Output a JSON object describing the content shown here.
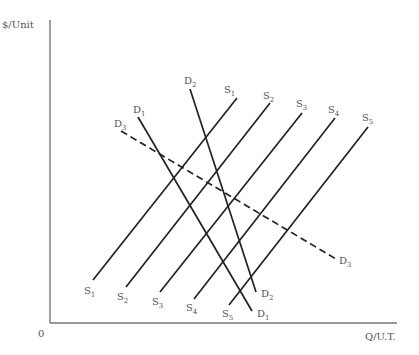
{
  "diagram": {
    "y_axis_label": "$/Unit",
    "x_axis_label": "Q/U.T.",
    "origin_label": "0",
    "colors": {
      "line": "#222222",
      "axis": "#777777",
      "text": "#555555"
    }
  },
  "chart_data": {
    "type": "line",
    "title": "",
    "xlabel": "Q/U.T.",
    "ylabel": "$/Unit",
    "series": [
      {
        "name": "S1",
        "style": "solid",
        "kind": "supply",
        "start_label": "S",
        "sub": "1",
        "points": [
          [
            93,
            280
          ],
          [
            237,
            98
          ]
        ]
      },
      {
        "name": "S2",
        "style": "solid",
        "kind": "supply",
        "start_label": "S",
        "sub": "2",
        "points": [
          [
            126,
            287
          ],
          [
            270,
            103
          ]
        ]
      },
      {
        "name": "S3",
        "style": "solid",
        "kind": "supply",
        "start_label": "S",
        "sub": "3",
        "points": [
          [
            160,
            292
          ],
          [
            302,
            113
          ]
        ]
      },
      {
        "name": "S4",
        "style": "solid",
        "kind": "supply",
        "start_label": "S",
        "sub": "4",
        "points": [
          [
            194,
            299
          ],
          [
            335,
            118
          ]
        ]
      },
      {
        "name": "S5",
        "style": "solid",
        "kind": "supply",
        "start_label": "S",
        "sub": "5",
        "points": [
          [
            229,
            305
          ],
          [
            368,
            127
          ]
        ]
      },
      {
        "name": "D1",
        "style": "solid",
        "kind": "demand",
        "start_label": "D",
        "sub": "1",
        "points": [
          [
            138,
            117
          ],
          [
            252,
            311
          ]
        ]
      },
      {
        "name": "D2",
        "style": "solid",
        "kind": "demand",
        "start_label": "D",
        "sub": "2",
        "points": [
          [
            190,
            89
          ],
          [
            256,
            292
          ]
        ]
      },
      {
        "name": "D3",
        "style": "dashed",
        "kind": "demand",
        "start_label": "D",
        "sub": "3",
        "points": [
          [
            121,
            131
          ],
          [
            336,
            259
          ]
        ]
      }
    ],
    "labels": [
      {
        "text": "S",
        "sub": "1",
        "x": 224,
        "y": 93
      },
      {
        "text": "S",
        "sub": "2",
        "x": 263,
        "y": 99
      },
      {
        "text": "S",
        "sub": "3",
        "x": 296,
        "y": 107
      },
      {
        "text": "S",
        "sub": "4",
        "x": 328,
        "y": 113
      },
      {
        "text": "S",
        "sub": "5",
        "x": 362,
        "y": 121
      },
      {
        "text": "D",
        "sub": "2",
        "x": 184,
        "y": 84
      },
      {
        "text": "D",
        "sub": "1",
        "x": 133,
        "y": 113
      },
      {
        "text": "D",
        "sub": "3",
        "x": 114,
        "y": 127
      },
      {
        "text": "S",
        "sub": "1",
        "x": 84,
        "y": 294
      },
      {
        "text": "S",
        "sub": "2",
        "x": 117,
        "y": 300
      },
      {
        "text": "S",
        "sub": "3",
        "x": 152,
        "y": 305
      },
      {
        "text": "S",
        "sub": "4",
        "x": 186,
        "y": 311
      },
      {
        "text": "S",
        "sub": "5",
        "x": 222,
        "y": 317
      },
      {
        "text": "D",
        "sub": "2",
        "x": 261,
        "y": 297
      },
      {
        "text": "D",
        "sub": "1",
        "x": 257,
        "y": 317
      },
      {
        "text": "D",
        "sub": "3",
        "x": 339,
        "y": 264
      }
    ],
    "axes": {
      "origin": [
        50,
        323
      ],
      "x_end": 397,
      "y_top": 20
    },
    "grid": false,
    "legend": "none"
  }
}
